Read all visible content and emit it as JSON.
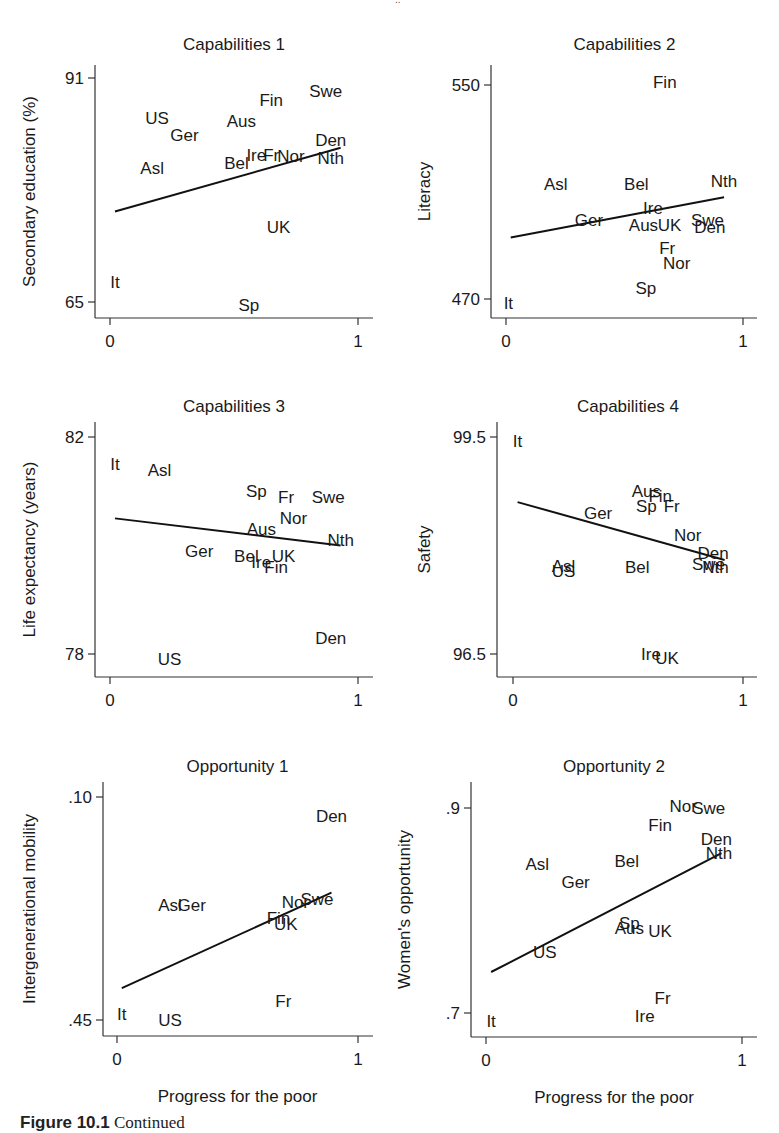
{
  "figure": {
    "caption_label": "Figure 10.1",
    "caption_text": "Continued"
  },
  "chart_data": [
    {
      "type": "scatter",
      "title": "Capabilities 1",
      "xlabel": "",
      "ylabel": "Secondary education (%)",
      "xlim": [
        0,
        1
      ],
      "ylim": [
        65,
        91
      ],
      "xticks": [
        "0",
        "1"
      ],
      "yticks": [
        "65",
        "91"
      ],
      "marker": "text-labels",
      "fit_line": {
        "x": [
          0.02,
          0.93
        ],
        "y": [
          75.5,
          82.9
        ]
      },
      "panel": {
        "left": 95,
        "top": 58,
        "x0": 110,
        "x1": 358,
        "y0px": 302,
        "y1px": 78,
        "axisY": 318,
        "axisTop": 65,
        "axisRight": 373,
        "ylabel_x": 35
      },
      "points": [
        {
          "label": "US",
          "x": 0.19,
          "y": 86.3
        },
        {
          "label": "Ger",
          "x": 0.3,
          "y": 84.4
        },
        {
          "label": "Asl",
          "x": 0.17,
          "y": 80.5
        },
        {
          "label": "Aus",
          "x": 0.53,
          "y": 86.0
        },
        {
          "label": "Fin",
          "x": 0.65,
          "y": 88.5
        },
        {
          "label": "Swe",
          "x": 0.87,
          "y": 89.5
        },
        {
          "label": "Den",
          "x": 0.89,
          "y": 83.8
        },
        {
          "label": "Nth",
          "x": 0.89,
          "y": 81.7
        },
        {
          "label": "Bel",
          "x": 0.51,
          "y": 81.1
        },
        {
          "label": "Ire",
          "x": 0.59,
          "y": 82.1
        },
        {
          "label": "Fr",
          "x": 0.65,
          "y": 82.1
        },
        {
          "label": "Nor",
          "x": 0.73,
          "y": 81.9
        },
        {
          "label": "UK",
          "x": 0.68,
          "y": 73.7
        },
        {
          "label": "It",
          "x": 0.02,
          "y": 67.3
        },
        {
          "label": "Sp",
          "x": 0.56,
          "y": 64.6
        }
      ]
    },
    {
      "type": "scatter",
      "title": "Capabilities 2",
      "xlabel": "",
      "ylabel": "Literacy",
      "xlim": [
        0,
        1
      ],
      "ylim": [
        470,
        550
      ],
      "xticks": [
        "0",
        "1"
      ],
      "yticks": [
        "470",
        "550"
      ],
      "marker": "text-labels",
      "fit_line": {
        "x": [
          0.02,
          0.92
        ],
        "y": [
          493,
          508
        ]
      },
      "panel": {
        "left": 491,
        "top": 58,
        "x0": 506,
        "x1": 743,
        "y0px": 299,
        "y1px": 85,
        "axisY": 318,
        "axisTop": 65,
        "axisRight": 757,
        "ylabel_x": 430
      },
      "points": [
        {
          "label": "Fin",
          "x": 0.67,
          "y": 551
        },
        {
          "label": "Asl",
          "x": 0.21,
          "y": 513
        },
        {
          "label": "Bel",
          "x": 0.55,
          "y": 513
        },
        {
          "label": "Nth",
          "x": 0.92,
          "y": 514
        },
        {
          "label": "Ire",
          "x": 0.62,
          "y": 504
        },
        {
          "label": "Ger",
          "x": 0.35,
          "y": 499.5
        },
        {
          "label": "Aus",
          "x": 0.58,
          "y": 497.5
        },
        {
          "label": "UK",
          "x": 0.69,
          "y": 497.5
        },
        {
          "label": "Swe",
          "x": 0.85,
          "y": 499.5
        },
        {
          "label": "Den",
          "x": 0.86,
          "y": 497
        },
        {
          "label": "Fr",
          "x": 0.68,
          "y": 489
        },
        {
          "label": "Nor",
          "x": 0.72,
          "y": 483.5
        },
        {
          "label": "Sp",
          "x": 0.59,
          "y": 474
        },
        {
          "label": "It",
          "x": 0.01,
          "y": 468.5
        }
      ]
    },
    {
      "type": "scatter",
      "title": "Capabilities 3",
      "xlabel": "",
      "ylabel": "Life expectancy (years)",
      "xlim": [
        0,
        1
      ],
      "ylim": [
        78,
        82
      ],
      "xticks": [
        "0",
        "1"
      ],
      "yticks": [
        "78",
        "82"
      ],
      "marker": "text-labels",
      "fit_line": {
        "x": [
          0.02,
          0.93
        ],
        "y": [
          80.5,
          80.0
        ]
      },
      "panel": {
        "left": 95,
        "top": 420,
        "x0": 110,
        "x1": 358,
        "y0px": 654,
        "y1px": 437,
        "axisY": 677,
        "axisTop": 422,
        "axisRight": 373,
        "ylabel_x": 35
      },
      "points": [
        {
          "label": "It",
          "x": 0.02,
          "y": 81.5
        },
        {
          "label": "Asl",
          "x": 0.2,
          "y": 81.4
        },
        {
          "label": "Sp",
          "x": 0.59,
          "y": 81.0
        },
        {
          "label": "Fr",
          "x": 0.71,
          "y": 80.9
        },
        {
          "label": "Swe",
          "x": 0.88,
          "y": 80.9
        },
        {
          "label": "Nor",
          "x": 0.74,
          "y": 80.5
        },
        {
          "label": "Aus",
          "x": 0.61,
          "y": 80.3
        },
        {
          "label": "Nth",
          "x": 0.93,
          "y": 80.1
        },
        {
          "label": "Ger",
          "x": 0.36,
          "y": 79.9
        },
        {
          "label": "Bel",
          "x": 0.55,
          "y": 79.8
        },
        {
          "label": "Ire",
          "x": 0.61,
          "y": 79.7
        },
        {
          "label": "UK",
          "x": 0.7,
          "y": 79.8
        },
        {
          "label": "Fin",
          "x": 0.67,
          "y": 79.6
        },
        {
          "label": "Den",
          "x": 0.89,
          "y": 78.3
        },
        {
          "label": "US",
          "x": 0.24,
          "y": 77.9
        }
      ]
    },
    {
      "type": "scatter",
      "title": "Capabilities 4",
      "xlabel": "",
      "ylabel": "Safety",
      "xlim": [
        0,
        1
      ],
      "ylim": [
        96.5,
        99.5
      ],
      "xticks": [
        "0",
        "1"
      ],
      "yticks": [
        "96.5",
        "99.5"
      ],
      "marker": "text-labels",
      "fit_line": {
        "x": [
          0.02,
          0.92
        ],
        "y": [
          98.6,
          97.8
        ]
      },
      "panel": {
        "left": 497,
        "top": 420,
        "x0": 513,
        "x1": 743,
        "y0px": 654,
        "y1px": 437,
        "axisY": 677,
        "axisTop": 422,
        "axisRight": 757,
        "ylabel_x": 430
      },
      "points": [
        {
          "label": "It",
          "x": 0.02,
          "y": 99.45
        },
        {
          "label": "Aus",
          "x": 0.58,
          "y": 98.75
        },
        {
          "label": "Fin",
          "x": 0.64,
          "y": 98.68
        },
        {
          "label": "Sp",
          "x": 0.58,
          "y": 98.55
        },
        {
          "label": "Fr",
          "x": 0.69,
          "y": 98.55
        },
        {
          "label": "Ger",
          "x": 0.37,
          "y": 98.45
        },
        {
          "label": "Nor",
          "x": 0.76,
          "y": 98.15
        },
        {
          "label": "Den",
          "x": 0.87,
          "y": 97.9
        },
        {
          "label": "Swe",
          "x": 0.85,
          "y": 97.75
        },
        {
          "label": "Nth",
          "x": 0.88,
          "y": 97.7
        },
        {
          "label": "Asl",
          "x": 0.22,
          "y": 97.72
        },
        {
          "label": "US",
          "x": 0.22,
          "y": 97.65
        },
        {
          "label": "Bel",
          "x": 0.54,
          "y": 97.7
        },
        {
          "label": "Ire",
          "x": 0.6,
          "y": 96.5
        },
        {
          "label": "UK",
          "x": 0.67,
          "y": 96.45
        }
      ]
    },
    {
      "type": "scatter",
      "title": "Opportunity 1",
      "xlabel": "Progress for the poor",
      "ylabel": "Intergenerational mobility",
      "xlim": [
        0,
        1
      ],
      "ylim": [
        0.45,
        0.1
      ],
      "y_inverted": true,
      "xticks": [
        "0",
        "1"
      ],
      "yticks": [
        ".45",
        ".10"
      ],
      "marker": "text-labels",
      "fit_line": {
        "x": [
          0.02,
          0.89
        ],
        "y": [
          0.4,
          0.25
        ]
      },
      "panel": {
        "left": 103,
        "top": 780,
        "x0": 117,
        "x1": 358,
        "y0px": 1020,
        "y1px": 797,
        "axisY": 1036,
        "axisTop": 782,
        "axisRight": 373,
        "ylabel_x": 35
      },
      "points": [
        {
          "label": "Den",
          "x": 0.89,
          "y": 0.13
        },
        {
          "label": "Asl",
          "x": 0.22,
          "y": 0.27
        },
        {
          "label": "Ger",
          "x": 0.31,
          "y": 0.27
        },
        {
          "label": "Nor",
          "x": 0.74,
          "y": 0.265
        },
        {
          "label": "Swe",
          "x": 0.83,
          "y": 0.26
        },
        {
          "label": "Fin",
          "x": 0.67,
          "y": 0.29
        },
        {
          "label": "UK",
          "x": 0.7,
          "y": 0.3
        },
        {
          "label": "Fr",
          "x": 0.69,
          "y": 0.42
        },
        {
          "label": "It",
          "x": 0.02,
          "y": 0.44
        },
        {
          "label": "US",
          "x": 0.22,
          "y": 0.45
        }
      ]
    },
    {
      "type": "scatter",
      "title": "Opportunity 2",
      "xlabel": "Progress for the poor",
      "ylabel": "Women's opportunity",
      "xlim": [
        0,
        1
      ],
      "ylim": [
        0.7,
        0.9
      ],
      "xticks": [
        "0",
        "1"
      ],
      "yticks": [
        ".7",
        ".9"
      ],
      "marker": "text-labels",
      "fit_line": {
        "x": [
          0.02,
          0.92
        ],
        "y": [
          0.74,
          0.856
        ]
      },
      "panel": {
        "left": 471,
        "top": 780,
        "x0": 486,
        "x1": 742,
        "y0px": 1013,
        "y1px": 808,
        "axisY": 1037,
        "axisTop": 782,
        "axisRight": 757,
        "ylabel_x": 410
      },
      "points": [
        {
          "label": "Nor",
          "x": 0.77,
          "y": 0.902
        },
        {
          "label": "Swe",
          "x": 0.87,
          "y": 0.9
        },
        {
          "label": "Fin",
          "x": 0.68,
          "y": 0.883
        },
        {
          "label": "Den",
          "x": 0.9,
          "y": 0.87
        },
        {
          "label": "Nth",
          "x": 0.91,
          "y": 0.856
        },
        {
          "label": "Bel",
          "x": 0.55,
          "y": 0.848
        },
        {
          "label": "Asl",
          "x": 0.2,
          "y": 0.845
        },
        {
          "label": "Ger",
          "x": 0.35,
          "y": 0.828
        },
        {
          "label": "Sp",
          "x": 0.56,
          "y": 0.788
        },
        {
          "label": "Aus",
          "x": 0.56,
          "y": 0.783
        },
        {
          "label": "UK",
          "x": 0.68,
          "y": 0.78
        },
        {
          "label": "US",
          "x": 0.23,
          "y": 0.76
        },
        {
          "label": "Fr",
          "x": 0.69,
          "y": 0.715
        },
        {
          "label": "Ire",
          "x": 0.62,
          "y": 0.697
        },
        {
          "label": "It",
          "x": 0.02,
          "y": 0.692
        }
      ]
    }
  ]
}
